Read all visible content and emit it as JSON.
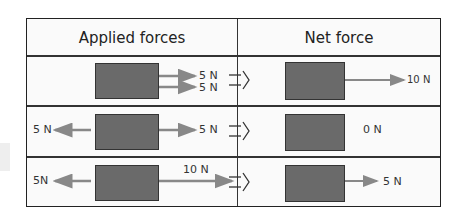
{
  "header": {
    "applied": "Applied forces",
    "net": "Net force"
  },
  "rows": [
    {
      "applied": {
        "right_top": "5 N",
        "right_bottom": "5 N"
      },
      "net": "10 N"
    },
    {
      "applied": {
        "left": "5 N",
        "right": "5 N"
      },
      "net": "0 N"
    },
    {
      "applied": {
        "left": "5N",
        "right": "10 N"
      },
      "net": "5 N"
    }
  ],
  "colors": {
    "box": "#6a6a6a",
    "arrow": "#888888",
    "border": "#222222"
  }
}
